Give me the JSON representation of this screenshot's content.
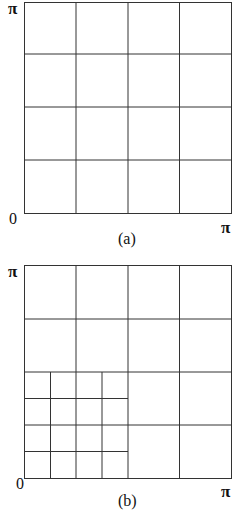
{
  "panels": [
    {
      "id": "a",
      "caption": "(a)",
      "axis": {
        "origin_label": "0",
        "x_max_label": "π",
        "y_max_label": "π"
      },
      "grid": {
        "type": "uniform",
        "divisions": 4
      },
      "box": {
        "x": 24,
        "y": 2,
        "w": 207,
        "h": 211
      }
    },
    {
      "id": "b",
      "caption": "(b)",
      "axis": {
        "origin_label": "0",
        "x_max_label": "π",
        "y_max_label": "π"
      },
      "grid": {
        "type": "refined",
        "coarse_divisions": 4,
        "refined_region": "lower-left quadrant",
        "refined_divisions": 4
      },
      "box": {
        "x": 24,
        "y": 265,
        "w": 207,
        "h": 213
      }
    }
  ],
  "colors": {
    "line": "#333333",
    "background": "#ffffff",
    "text": "#111111"
  }
}
